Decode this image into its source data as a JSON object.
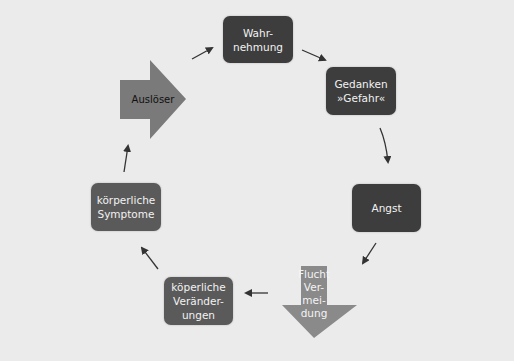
{
  "diagram": {
    "title": "",
    "nodes": {
      "wahrnehmung": {
        "label": "Wahr-\nnehmung"
      },
      "gedanken": {
        "label": "Gedanken\n»Gefahr«"
      },
      "angst": {
        "label": "Angst"
      },
      "flucht": {
        "label": "Flucht\nVer-\nmei-\ndung"
      },
      "veraenderungen": {
        "label": "köperliche\nVerän­der-\nungen"
      },
      "symptome": {
        "label": "körperliche\nSymptome"
      },
      "ausloeser": {
        "label": "Auslöser"
      }
    },
    "cycle_order": [
      "Auslöser",
      "Wahrnehmung",
      "Gedanken »Gefahr«",
      "Angst",
      "Flucht Vermeidung",
      "köperliche Veränderungen",
      "körperliche Symptome"
    ],
    "colors": {
      "background": "#ebebeb",
      "box_dark": "#3d3d3d",
      "box_mid": "#5a5a5a",
      "arrow_shape": "#7a7a7a",
      "connector": "#333333"
    }
  }
}
